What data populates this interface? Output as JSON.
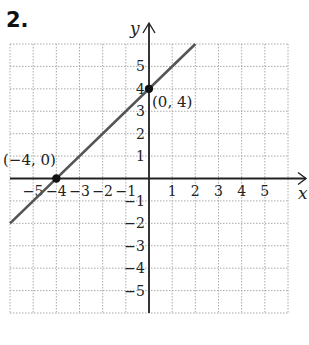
{
  "problem_number": "2.",
  "chart_data": {
    "type": "line",
    "title": "",
    "xlabel": "x",
    "ylabel": "y",
    "xlim": [
      -6,
      6
    ],
    "ylim": [
      -6,
      6
    ],
    "grid": true,
    "x_ticks": [
      "-5",
      "-4",
      "-3",
      "-2",
      "-1",
      "1",
      "2",
      "3",
      "4",
      "5"
    ],
    "y_ticks": [
      "5",
      "4",
      "3",
      "2",
      "1",
      "-1",
      "-2",
      "-3",
      "-4",
      "-5"
    ],
    "series": [
      {
        "name": "line",
        "x": [
          -6,
          2
        ],
        "y": [
          -2,
          6
        ],
        "color": "#555555"
      }
    ],
    "points": [
      {
        "label": "(−4, 0)",
        "x": -4,
        "y": 0
      },
      {
        "label": "(0, 4)",
        "x": 0,
        "y": 4
      }
    ]
  }
}
